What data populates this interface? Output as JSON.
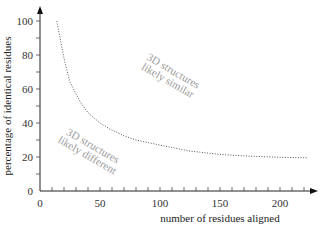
{
  "chart_data": {
    "type": "line",
    "title": "",
    "xlabel": "number of residues aligned",
    "ylabel": "percentage of identical residues",
    "xlim": [
      0,
      232
    ],
    "ylim": [
      0,
      108
    ],
    "x_ticks": [
      0,
      50,
      100,
      150,
      200
    ],
    "y_ticks": [
      0,
      20,
      40,
      60,
      80,
      100
    ],
    "x_minor_step": 10,
    "y_minor_step": 10,
    "grid": false,
    "legend": null,
    "series": [
      {
        "name": "threshold curve",
        "style": "dotted",
        "x": [
          14,
          20,
          25,
          33,
          40,
          50,
          58,
          70,
          80,
          100,
          125,
          150,
          175,
          200,
          223
        ],
        "y": [
          100,
          78,
          64,
          53,
          46,
          40,
          36.5,
          32.5,
          30,
          27,
          23.5,
          21.5,
          20.5,
          19.8,
          19.5
        ]
      }
    ],
    "annotations": [
      {
        "text_lines": [
          "3D structures",
          "likely similar"
        ],
        "x": 109,
        "y": 68,
        "rotation": 30
      },
      {
        "text_lines": [
          "3D structures",
          "likely different"
        ],
        "x": 42,
        "y": 24,
        "rotation": 30
      }
    ]
  }
}
